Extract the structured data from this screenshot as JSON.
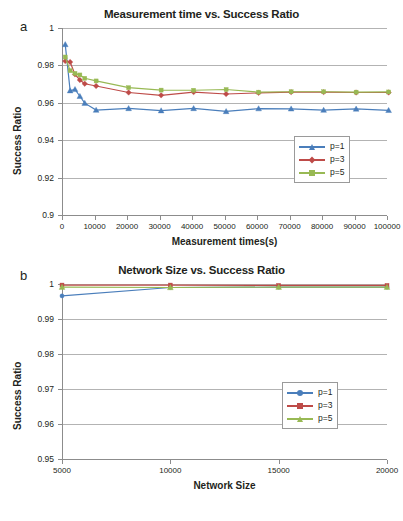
{
  "figure": {
    "panel_a_letter": "a",
    "panel_b_letter": "b"
  },
  "chart_data": [
    {
      "type": "line",
      "panel": "a",
      "title": "Measurement time vs. Success Ratio",
      "xlabel": "Measurement times(s)",
      "ylabel": "Success Ratio",
      "xlim": [
        0,
        100000
      ],
      "ylim": [
        0.9,
        1
      ],
      "xticks": [
        0,
        10000,
        20000,
        30000,
        40000,
        50000,
        60000,
        70000,
        80000,
        90000,
        100000
      ],
      "xtick_labels": [
        "0",
        "10000",
        "20000",
        "30000",
        "40000",
        "50000",
        "60000",
        "70000",
        "80000",
        "90000",
        "100000"
      ],
      "yticks": [
        0.9,
        0.92,
        0.94,
        0.96,
        0.98,
        1
      ],
      "ytick_labels": [
        "0.9",
        "0.92",
        "0.94",
        "0.96",
        "0.98",
        "1"
      ],
      "grid": "horizontal",
      "legend_position": "inside-right",
      "x": [
        1000,
        2500,
        4000,
        5500,
        7000,
        10500,
        20500,
        30500,
        40500,
        50500,
        60500,
        70500,
        80500,
        90500,
        100500
      ],
      "series": [
        {
          "name": "p=1",
          "color": "#4a7ebb",
          "marker": "triangle",
          "values": [
            0.9912,
            0.9665,
            0.9672,
            0.9635,
            0.9598,
            0.9561,
            0.957,
            0.9558,
            0.957,
            0.9554,
            0.9569,
            0.9568,
            0.9561,
            0.9567,
            0.956
          ]
        },
        {
          "name": "p=3",
          "color": "#be4b48",
          "marker": "diamond",
          "values": [
            0.9823,
            0.9818,
            0.9752,
            0.9722,
            0.9702,
            0.969,
            0.9655,
            0.964,
            0.9657,
            0.9647,
            0.9653,
            0.9657,
            0.9657,
            0.9655,
            0.9655
          ]
        },
        {
          "name": "p=5",
          "color": "#98b954",
          "marker": "square",
          "values": [
            0.9845,
            0.9772,
            0.9757,
            0.9749,
            0.9731,
            0.9717,
            0.9681,
            0.9668,
            0.9667,
            0.9671,
            0.9657,
            0.9659,
            0.9659,
            0.9657,
            0.9658
          ]
        }
      ],
      "legend": [
        {
          "label": "p=1",
          "color": "#4a7ebb",
          "marker": "triangle"
        },
        {
          "label": "p=3",
          "color": "#be4b48",
          "marker": "diamond"
        },
        {
          "label": "p=5",
          "color": "#98b954",
          "marker": "square"
        }
      ]
    },
    {
      "type": "line",
      "panel": "b",
      "title": "Network Size vs. Success Ratio",
      "xlabel": "Network Size",
      "ylabel": "Success Ratio",
      "xlim": [
        5000,
        20000
      ],
      "ylim": [
        0.95,
        1
      ],
      "xticks": [
        5000,
        10000,
        15000,
        20000
      ],
      "xtick_labels": [
        "5000",
        "10000",
        "15000",
        "20000"
      ],
      "yticks": [
        0.95,
        0.96,
        0.97,
        0.98,
        0.99,
        1
      ],
      "ytick_labels": [
        "0.95",
        "0.96",
        "0.97",
        "0.98",
        "0.99",
        "1"
      ],
      "grid": "horizontal",
      "legend_position": "inside-right",
      "x": [
        5000,
        10000,
        15000,
        20000
      ],
      "series": [
        {
          "name": "p=1",
          "color": "#4a7ebb",
          "marker": "circle",
          "values": [
            0.9966,
            0.999,
            0.9991,
            0.9991
          ]
        },
        {
          "name": "p=3",
          "color": "#be4b48",
          "marker": "square",
          "values": [
            0.9997,
            0.9997,
            0.9996,
            0.9996
          ]
        },
        {
          "name": "p=5",
          "color": "#98b954",
          "marker": "triangle",
          "values": [
            0.9991,
            0.999,
            0.9991,
            0.9991
          ]
        }
      ],
      "legend": [
        {
          "label": "p=1",
          "color": "#4a7ebb",
          "marker": "circle"
        },
        {
          "label": "p=3",
          "color": "#be4b48",
          "marker": "square"
        },
        {
          "label": "p=5",
          "color": "#98b954",
          "marker": "triangle"
        }
      ]
    }
  ]
}
